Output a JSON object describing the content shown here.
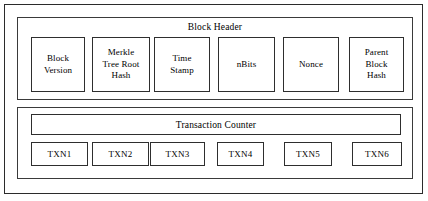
{
  "diagram": {
    "type": "block-diagram",
    "colors": {
      "background": "#ffffff",
      "outer_border": "#2b2b2b",
      "panel_border": "#3a3a3a",
      "box_border": "#2e2e2e",
      "text": "#000000"
    }
  },
  "block_header": {
    "title": "Block Header",
    "fields": [
      {
        "label": "Block\nVersion",
        "lines": [
          "Block",
          "Version"
        ],
        "name": "block-version"
      },
      {
        "label": "Merkle Tree Root Hash",
        "lines": [
          "Merkle",
          "Tree Root",
          "Hash"
        ],
        "name": "merkle-tree-root-hash"
      },
      {
        "label": "Time Stamp",
        "lines": [
          "Time",
          "Stamp"
        ],
        "name": "time-stamp"
      },
      {
        "label": "nBits",
        "lines": [
          "nBits"
        ],
        "name": "nbits"
      },
      {
        "label": "Nonce",
        "lines": [
          "Nonce"
        ],
        "name": "nonce"
      },
      {
        "label": "Parent Block Hash",
        "lines": [
          "Parent",
          "Block",
          "Hash"
        ],
        "name": "parent-block-hash"
      }
    ]
  },
  "transactions": {
    "counter_label": "Transaction Counter",
    "items": [
      {
        "label": "TXN1"
      },
      {
        "label": "TXN2"
      },
      {
        "label": "TXN3"
      },
      {
        "label": "TXN4"
      },
      {
        "label": "TXN5"
      },
      {
        "label": "TXN6"
      }
    ]
  }
}
